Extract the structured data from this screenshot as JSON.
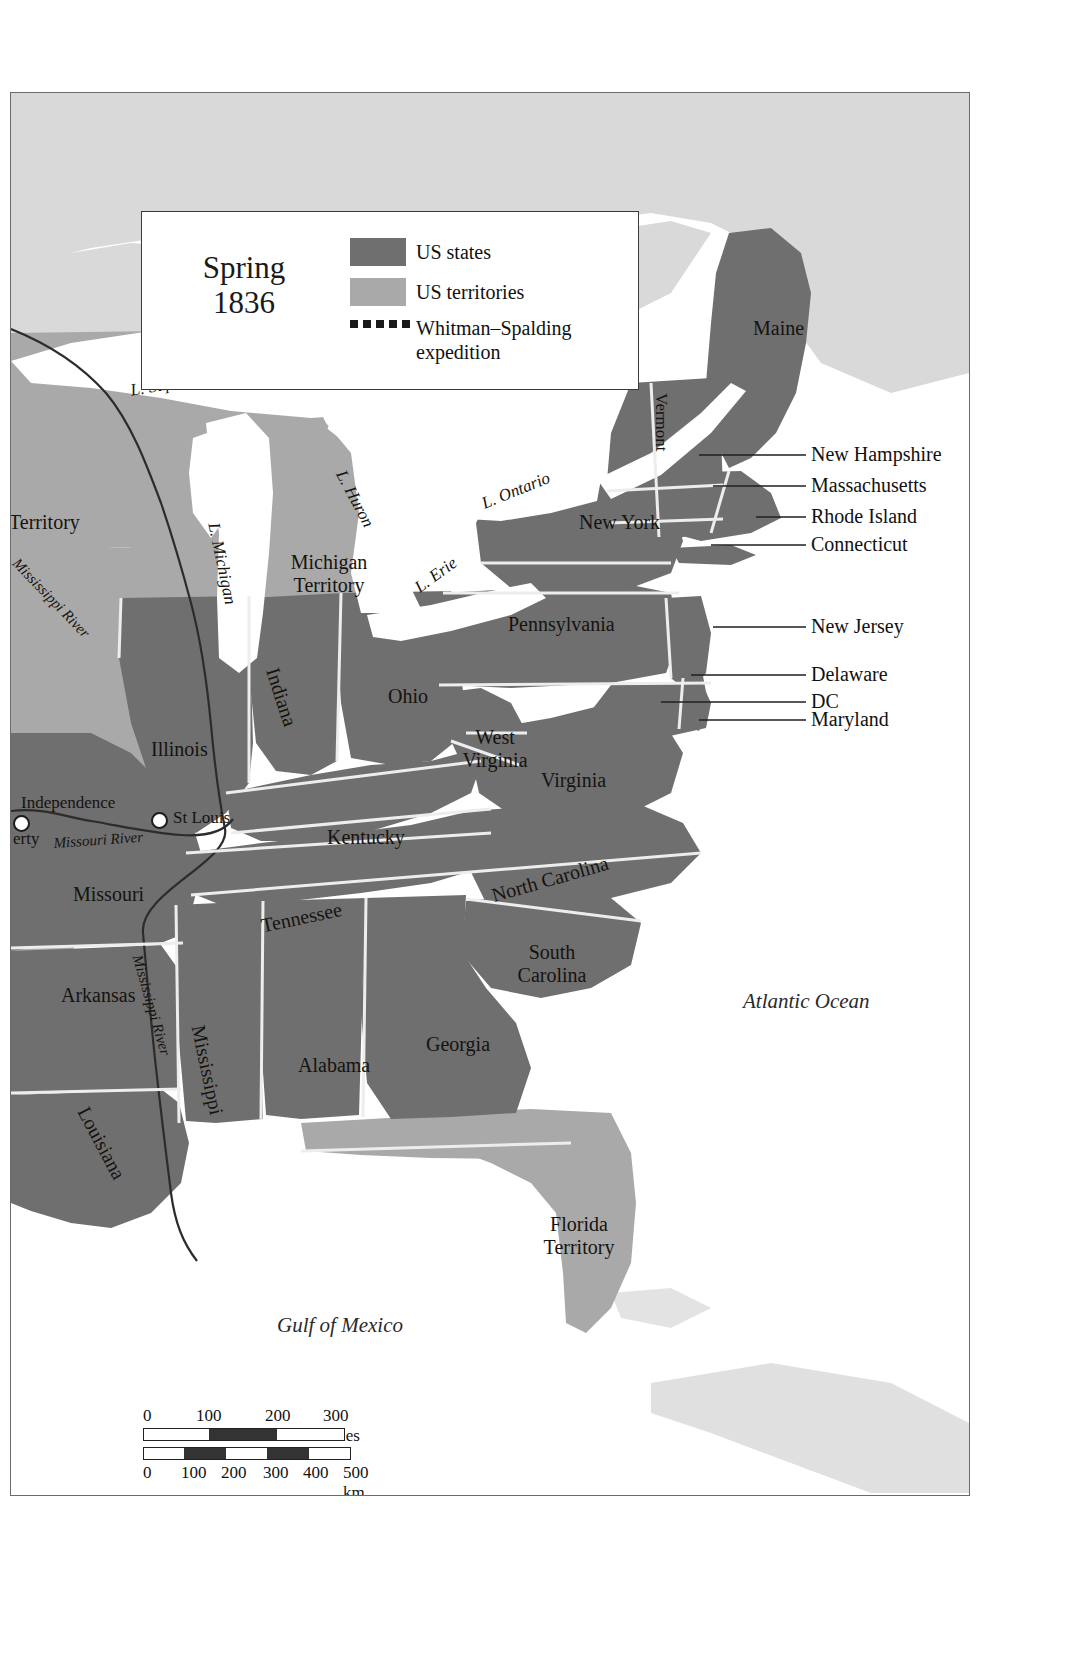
{
  "map": {
    "title": "Spring",
    "year": "1836",
    "legend": {
      "items": [
        {
          "label": "US states",
          "swatch": "#6f6f6f",
          "type": "swatch"
        },
        {
          "label": "US territories",
          "swatch": "#a9a9a9",
          "type": "swatch"
        },
        {
          "label": "Whitman–Spalding expedition",
          "swatch": "#1a1a1a",
          "type": "dotted-line"
        }
      ]
    },
    "colors": {
      "states": "#6f6f6f",
      "territories": "#a9a9a9",
      "ocean": "#ffffff",
      "lakes": "#ffffff",
      "outside_land": "#d5d5d5",
      "border": "#6b6b6b",
      "text": "#16130f",
      "state_boundary": "#e8e8e8"
    },
    "state_labels": [
      {
        "name": "Maine",
        "x": 742,
        "y": 224,
        "rotate": 0,
        "size": "state"
      },
      {
        "name": "Vermont",
        "x": 668,
        "y": 303,
        "rotate": 90,
        "size": "small"
      },
      {
        "name": "New York",
        "x": 568,
        "y": 418,
        "rotate": 0,
        "size": "state"
      },
      {
        "name": "Pennsylvania",
        "x": 497,
        "y": 520,
        "rotate": 0,
        "size": "state"
      },
      {
        "name": "Ohio",
        "x": 377,
        "y": 592,
        "rotate": 0,
        "size": "state"
      },
      {
        "name": "Indiana",
        "x": 276,
        "y": 590,
        "rotate": 70,
        "size": "state"
      },
      {
        "name": "Illinois",
        "x": 140,
        "y": 645,
        "rotate": 0,
        "size": "state"
      },
      {
        "name": "Michigan Territory",
        "x": 266,
        "y": 460,
        "rotate": 0,
        "size": "two"
      },
      {
        "name": "West Virginia",
        "x": 450,
        "y": 638,
        "rotate": 0,
        "size": "two"
      },
      {
        "name": "Virginia",
        "x": 537,
        "y": 676,
        "rotate": 0,
        "size": "state"
      },
      {
        "name": "Kentucky",
        "x": 320,
        "y": 733,
        "rotate": 0,
        "size": "state"
      },
      {
        "name": "Missouri",
        "x": 66,
        "y": 790,
        "rotate": 0,
        "size": "state"
      },
      {
        "name": "Tennessee",
        "x": 253,
        "y": 818,
        "rotate": -12,
        "size": "state"
      },
      {
        "name": "North Carolina",
        "x": 481,
        "y": 783,
        "rotate": -16,
        "size": "state"
      },
      {
        "name": "South Carolina",
        "x": 501,
        "y": 853,
        "rotate": 0,
        "size": "two"
      },
      {
        "name": "Arkansas",
        "x": 54,
        "y": 891,
        "rotate": 0,
        "size": "state"
      },
      {
        "name": "Georgia",
        "x": 419,
        "y": 940,
        "rotate": 0,
        "size": "state"
      },
      {
        "name": "Alabama",
        "x": 291,
        "y": 961,
        "rotate": 0,
        "size": "state"
      },
      {
        "name": "Mississippi",
        "x": 201,
        "y": 940,
        "rotate": 78,
        "size": "state"
      },
      {
        "name": "Louisiana",
        "x": 84,
        "y": 1014,
        "rotate": 62,
        "size": "state"
      },
      {
        "name": "Florida Territory",
        "x": 530,
        "y": 1125,
        "rotate": 0,
        "size": "two"
      },
      {
        "name": "Territory",
        "x": 2,
        "y": 418,
        "rotate": 0,
        "size": "state"
      }
    ],
    "lake_labels": [
      {
        "name": "L. Superior",
        "x": 126,
        "y": 290,
        "rotate": -10
      },
      {
        "name": "L. Michigan",
        "x": 207,
        "y": 432,
        "rotate": 78
      },
      {
        "name": "L. Huron",
        "x": 340,
        "y": 378,
        "rotate": 62
      },
      {
        "name": "L. Ontario",
        "x": 477,
        "y": 398,
        "rotate": -22
      },
      {
        "name": "L. Erie",
        "x": 405,
        "y": 490,
        "rotate": -38
      }
    ],
    "water_labels": [
      {
        "name": "Atlantic Ocean",
        "x": 742,
        "y": 897
      },
      {
        "name": "Gulf of Mexico",
        "x": 274,
        "y": 1221
      }
    ],
    "river_labels": [
      {
        "name": "Mississippi River",
        "x": 14,
        "y": 466,
        "rotate": 46
      },
      {
        "name": "Missouri River",
        "x": 48,
        "y": 743,
        "rotate": -6
      },
      {
        "name": "Mississippi River",
        "x": 136,
        "y": 868,
        "rotate": 74
      }
    ],
    "cities": [
      {
        "name": "Independence",
        "x": 0,
        "y": 698,
        "dot_x": 6,
        "dot_y": 722,
        "label_x": 8,
        "label_y": 700
      },
      {
        "name": "erty",
        "x": 4,
        "y": 733,
        "dot_x": -1,
        "dot_y": -1,
        "label_x": 4,
        "label_y": 733
      },
      {
        "name": "St Louis",
        "x": 165,
        "y": 717,
        "dot_x": 147,
        "dot_y": 722,
        "label_x": 165,
        "label_y": 717
      }
    ],
    "callouts": [
      {
        "label": "New Hampshire",
        "label_x": 812,
        "label_y": 357,
        "line_x1": 710,
        "line_y1": 368,
        "line_x2": 805,
        "line_y2": 368,
        "tick_x": 685,
        "tick_y": 360
      },
      {
        "label": "Massachusetts",
        "label_x": 812,
        "label_y": 388,
        "line_x1": 722,
        "line_y1": 399,
        "line_x2": 805,
        "line_y2": 399,
        "tick_x": 700,
        "tick_y": 392
      },
      {
        "label": "Rhode Island",
        "label_x": 812,
        "label_y": 419,
        "line_x1": 752,
        "line_y1": 430,
        "line_x2": 805,
        "line_y2": 430,
        "tick_x": 0,
        "tick_y": 0
      },
      {
        "label": "Connecticut",
        "label_x": 812,
        "label_y": 447,
        "line_x1": 703,
        "line_y1": 458,
        "line_x2": 805,
        "line_y2": 458,
        "tick_x": 0,
        "tick_y": 0
      },
      {
        "label": "New Jersey",
        "label_x": 812,
        "label_y": 529,
        "line_x1": 717,
        "line_y1": 540,
        "line_x2": 805,
        "line_y2": 540,
        "tick_x": 0,
        "tick_y": 0
      },
      {
        "label": "Delaware",
        "label_x": 812,
        "label_y": 577,
        "line_x1": 692,
        "line_y1": 588,
        "line_x2": 805,
        "line_y2": 588,
        "tick_x": 0,
        "tick_y": 0
      },
      {
        "label": "DC",
        "label_x": 812,
        "label_y": 604,
        "line_x1": 662,
        "line_y1": 615,
        "line_x2": 805,
        "line_y2": 615,
        "tick_x": 0,
        "tick_y": 0
      },
      {
        "label": "Maryland",
        "label_x": 812,
        "label_y": 622,
        "line_x1": 700,
        "line_y1": 632,
        "line_x2": 805,
        "line_y2": 632,
        "tick_x": 0,
        "tick_y": 0
      }
    ],
    "scale": {
      "miles_ticks": [
        "0",
        "100",
        "200",
        "300 miles"
      ],
      "km_ticks": [
        "0",
        "100",
        "200",
        "300",
        "400",
        "500 km"
      ]
    }
  }
}
